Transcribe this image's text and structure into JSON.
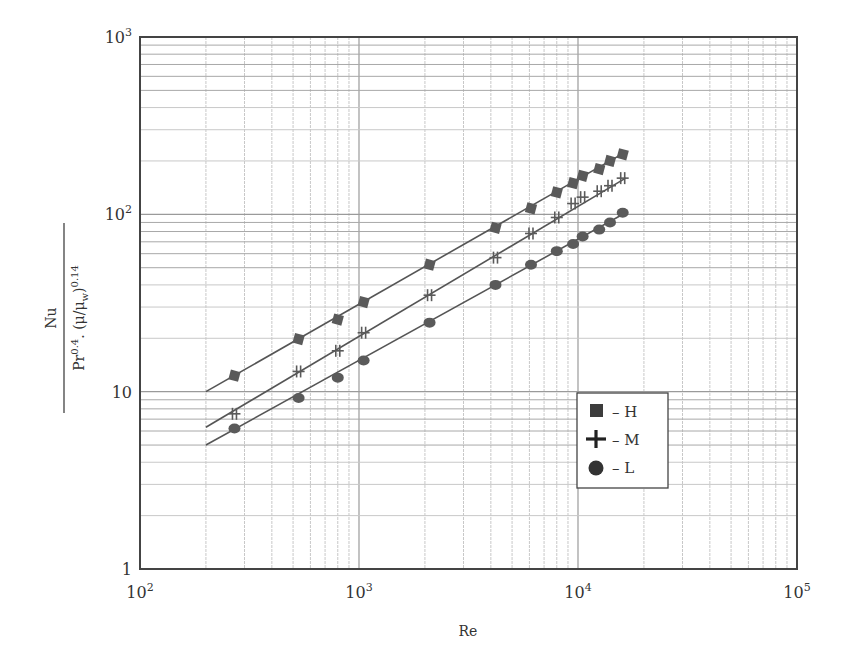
{
  "chart_data": {
    "type": "line",
    "title": "",
    "xlabel": "Re",
    "ylabel": "Nu / (Pr^0.4 · (μ/μw)^0.14)",
    "ylabel_parts": {
      "numerator": "Nu",
      "denominator": "Pr",
      "pr_exp": "0.4",
      "sep": ". (μ/μ",
      "w_sub": "w",
      "close": ")",
      "exp": "0.14"
    },
    "xscale": "log",
    "yscale": "log",
    "xlim": [
      100,
      100000
    ],
    "ylim": [
      1,
      1000
    ],
    "grid": true,
    "x_ticks": [
      {
        "base": "10",
        "exp": "2",
        "value": 100
      },
      {
        "base": "10",
        "exp": "3",
        "value": 1000
      },
      {
        "base": "10",
        "exp": "4",
        "value": 10000
      },
      {
        "base": "10",
        "exp": "5",
        "value": 100000
      }
    ],
    "y_ticks": [
      {
        "base": "1",
        "exp": "",
        "value": 1
      },
      {
        "base": "10",
        "exp": "",
        "value": 10
      },
      {
        "base": "10",
        "exp": "2",
        "value": 100
      },
      {
        "base": "10",
        "exp": "3",
        "value": 1000
      }
    ],
    "legend": {
      "position": "inside lower-right",
      "entries": [
        {
          "marker": "square",
          "label": "– H"
        },
        {
          "marker": "plus",
          "label": "– M"
        },
        {
          "marker": "circle",
          "label": "– L"
        }
      ]
    },
    "series": [
      {
        "name": "H",
        "marker": "square",
        "fit_line": {
          "x": [
            200,
            16000
          ],
          "y": [
            10.0,
            220
          ]
        },
        "x": [
          270,
          530,
          800,
          1050,
          2100,
          4200,
          6100,
          8000,
          9500,
          10500,
          12500,
          14000,
          16000
        ],
        "y": [
          12.3,
          19.8,
          25.5,
          32,
          52,
          84,
          108,
          133,
          150,
          165,
          180,
          200,
          218
        ]
      },
      {
        "name": "M",
        "marker": "plus",
        "fit_line": {
          "x": [
            200,
            16500
          ],
          "y": [
            6.3,
            160
          ]
        },
        "x": [
          270,
          530,
          800,
          1050,
          2100,
          4200,
          6100,
          8000,
          9500,
          10500,
          12500,
          14000,
          16000
        ],
        "y": [
          7.5,
          13,
          17,
          21.5,
          35,
          57,
          78,
          96,
          115,
          125,
          135,
          145,
          160
        ]
      },
      {
        "name": "L",
        "marker": "circle",
        "fit_line": {
          "x": [
            200,
            16500
          ],
          "y": [
            5.0,
            102
          ]
        },
        "x": [
          270,
          530,
          800,
          1050,
          2100,
          4200,
          6100,
          8000,
          9500,
          10500,
          12500,
          14000,
          16000
        ],
        "y": [
          6.2,
          9.2,
          12,
          15,
          24.5,
          40,
          52,
          62,
          68,
          75,
          82,
          90,
          102
        ]
      }
    ]
  },
  "colors": {
    "axis": "#444444",
    "grid_major": "#9a9a9a",
    "grid_minor": "#c8c8c8",
    "line": "#555555",
    "marker": "#5a5a5a"
  }
}
